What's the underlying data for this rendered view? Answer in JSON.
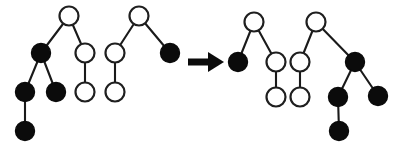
{
  "figure": {
    "canvas": {
      "width": 399,
      "height": 152,
      "background": "#ffffff"
    },
    "colors": {
      "node_black_fill": "#0b0b0b",
      "node_white_fill": "#ffffff",
      "node_stroke": "#1f1f1f",
      "edge_stroke": "#1a1a1a",
      "arrow_fill": "#0b0b0b"
    },
    "node_radius": 9.5,
    "legend": {
      "black_node_meaning": "filled node",
      "white_node_meaning": "hollow node"
    }
  },
  "arrow": {
    "name": "rightwards-transform-arrow",
    "label": "→",
    "shaft": {
      "x1": 188,
      "y1": 62,
      "x2": 210,
      "y2": 62,
      "thickness": 7
    },
    "head": {
      "points": "208,52 224,62 208,72"
    }
  },
  "chart_data": {
    "type": "diagram",
    "groups": [
      {
        "id": "left-tree-1",
        "side": "left",
        "label": "Source tree 1",
        "nodes": [
          {
            "id": "L1-a",
            "color": "white",
            "cx": 69,
            "cy": 16
          },
          {
            "id": "L1-b",
            "color": "black",
            "cx": 41,
            "cy": 53
          },
          {
            "id": "L1-c",
            "color": "white",
            "cx": 85,
            "cy": 53
          },
          {
            "id": "L1-d",
            "color": "black",
            "cx": 25,
            "cy": 92
          },
          {
            "id": "L1-e",
            "color": "black",
            "cx": 56,
            "cy": 92
          },
          {
            "id": "L1-f",
            "color": "white",
            "cx": 85,
            "cy": 92
          },
          {
            "id": "L1-g",
            "color": "black",
            "cx": 25,
            "cy": 131
          }
        ],
        "edges": [
          {
            "from": "L1-a",
            "to": "L1-b"
          },
          {
            "from": "L1-a",
            "to": "L1-c"
          },
          {
            "from": "L1-b",
            "to": "L1-d"
          },
          {
            "from": "L1-b",
            "to": "L1-e"
          },
          {
            "from": "L1-c",
            "to": "L1-f"
          },
          {
            "from": "L1-d",
            "to": "L1-g"
          }
        ]
      },
      {
        "id": "left-tree-2",
        "side": "left",
        "label": "Source tree 2",
        "nodes": [
          {
            "id": "L2-a",
            "color": "white",
            "cx": 139,
            "cy": 16
          },
          {
            "id": "L2-b",
            "color": "white",
            "cx": 115,
            "cy": 53
          },
          {
            "id": "L2-c",
            "color": "black",
            "cx": 170,
            "cy": 53
          },
          {
            "id": "L2-d",
            "color": "white",
            "cx": 115,
            "cy": 92
          }
        ],
        "edges": [
          {
            "from": "L2-a",
            "to": "L2-b"
          },
          {
            "from": "L2-a",
            "to": "L2-c"
          },
          {
            "from": "L2-b",
            "to": "L2-d"
          }
        ]
      },
      {
        "id": "right-tree-1",
        "side": "right",
        "label": "Result tree 1",
        "nodes": [
          {
            "id": "R1-a",
            "color": "white",
            "cx": 254,
            "cy": 22
          },
          {
            "id": "R1-b",
            "color": "black",
            "cx": 238,
            "cy": 62
          },
          {
            "id": "R1-c",
            "color": "white",
            "cx": 276,
            "cy": 62
          },
          {
            "id": "R1-d",
            "color": "white",
            "cx": 276,
            "cy": 97
          }
        ],
        "edges": [
          {
            "from": "R1-a",
            "to": "R1-b"
          },
          {
            "from": "R1-a",
            "to": "R1-c"
          },
          {
            "from": "R1-c",
            "to": "R1-d"
          }
        ]
      },
      {
        "id": "right-tree-2",
        "side": "right",
        "label": "Result tree 2",
        "nodes": [
          {
            "id": "R2-a",
            "color": "white",
            "cx": 316,
            "cy": 22
          },
          {
            "id": "R2-b",
            "color": "white",
            "cx": 300,
            "cy": 62
          },
          {
            "id": "R2-c",
            "color": "black",
            "cx": 355,
            "cy": 62
          },
          {
            "id": "R2-d",
            "color": "white",
            "cx": 300,
            "cy": 97
          },
          {
            "id": "R2-e",
            "color": "black",
            "cx": 338,
            "cy": 97
          },
          {
            "id": "R2-f",
            "color": "black",
            "cx": 378,
            "cy": 96
          },
          {
            "id": "R2-g",
            "color": "black",
            "cx": 339,
            "cy": 131
          }
        ],
        "edges": [
          {
            "from": "R2-a",
            "to": "R2-b"
          },
          {
            "from": "R2-a",
            "to": "R2-c"
          },
          {
            "from": "R2-b",
            "to": "R2-d"
          },
          {
            "from": "R2-c",
            "to": "R2-e"
          },
          {
            "from": "R2-c",
            "to": "R2-f"
          },
          {
            "from": "R2-e",
            "to": "R2-g"
          }
        ]
      }
    ]
  }
}
